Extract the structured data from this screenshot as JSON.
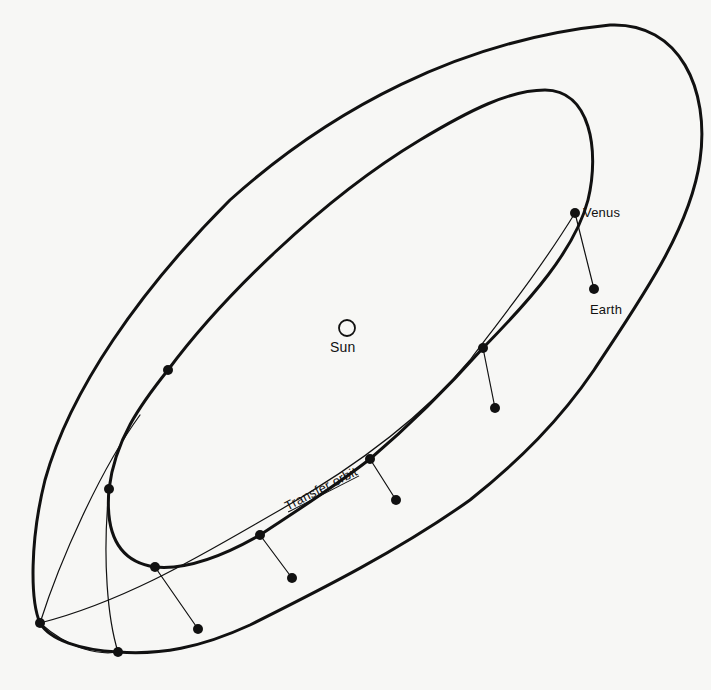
{
  "figure": {
    "labels": {
      "venus": "Venus",
      "earth": "Earth",
      "sun": "Sun",
      "transfer_orbit": "Transfer orbit"
    },
    "colors": {
      "ink": "#111111",
      "paper": "#f7f7f5"
    },
    "orbits": [
      {
        "name": "Earth orbit (outer)",
        "stroke_width": 3
      },
      {
        "name": "Venus orbit (inner)",
        "stroke_width": 3
      },
      {
        "name": "Transfer orbit",
        "stroke_width": 1.2
      }
    ],
    "bodies": {
      "sun": {
        "x": 347,
        "y": 328,
        "r": 8
      },
      "venus": {
        "x": 575,
        "y": 213
      },
      "earth": {
        "x": 594,
        "y": 289
      }
    },
    "position_pairs": [
      {
        "inner": [
          575,
          213
        ],
        "outer": [
          594,
          289
        ]
      },
      {
        "inner": [
          483,
          348
        ],
        "outer": [
          495,
          408
        ]
      },
      {
        "inner": [
          370,
          459
        ],
        "outer": [
          396,
          500
        ]
      },
      {
        "inner": [
          260,
          535
        ],
        "outer": [
          292,
          578
        ]
      },
      {
        "inner": [
          155,
          567
        ],
        "outer": [
          198,
          629
        ]
      },
      {
        "inner": [
          109,
          489
        ],
        "outer": [
          118,
          652
        ]
      },
      {
        "inner": [
          168,
          370
        ],
        "outer": [
          40,
          623
        ]
      }
    ]
  }
}
